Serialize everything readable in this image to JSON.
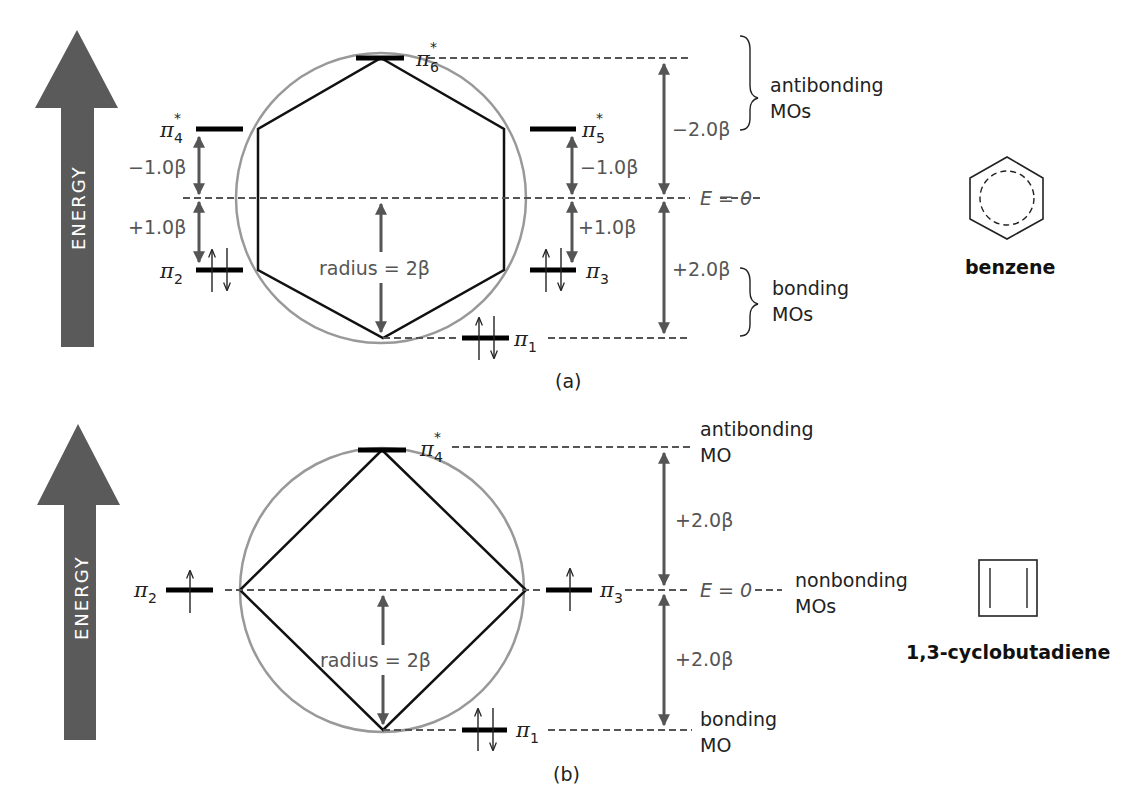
{
  "panel_a": {
    "caption": "(a)",
    "energy_label": "ENERGY",
    "molecule_name": "benzene",
    "levels": {
      "pi1": {
        "sym": "π",
        "sub": "1",
        "star": "",
        "electrons": "↑↓"
      },
      "pi2": {
        "sym": "π",
        "sub": "2",
        "star": "",
        "electrons": "↑↓"
      },
      "pi3": {
        "sym": "π",
        "sub": "3",
        "star": "",
        "electrons": "↑↓"
      },
      "pi4": {
        "sym": "π",
        "sub": "4",
        "star": "*",
        "electrons": ""
      },
      "pi5": {
        "sym": "π",
        "sub": "5",
        "star": "*",
        "electrons": ""
      },
      "pi6": {
        "sym": "π",
        "sub": "6",
        "star": "*",
        "electrons": ""
      }
    },
    "gaps": {
      "left_upper": "−1.0β",
      "left_lower": "+1.0β",
      "right_upper": "−1.0β",
      "right_lower": "+1.0β",
      "outer_upper": "−2.0β",
      "outer_lower": "+2.0β"
    },
    "radius_label": "radius = 2β",
    "zero_label": "E = 0",
    "antibonding_label": [
      "antibonding",
      "MOs"
    ],
    "bonding_label": [
      "bonding",
      "MOs"
    ]
  },
  "panel_b": {
    "caption": "(b)",
    "energy_label": "ENERGY",
    "molecule_name": "1,3-cyclobutadiene",
    "levels": {
      "pi1": {
        "sym": "π",
        "sub": "1",
        "star": "",
        "electrons": "↑↓"
      },
      "pi2": {
        "sym": "π",
        "sub": "2",
        "star": "",
        "electrons": "↑"
      },
      "pi3": {
        "sym": "π",
        "sub": "3",
        "star": "",
        "electrons": "↑"
      },
      "pi4": {
        "sym": "π",
        "sub": "4",
        "star": "*",
        "electrons": ""
      }
    },
    "gaps": {
      "outer_upper": "+2.0β",
      "outer_lower": "+2.0β"
    },
    "radius_label": "radius = 2β",
    "zero_label": "E = 0",
    "antibonding_label": [
      "antibonding",
      "MO"
    ],
    "nonbonding_label": [
      "nonbonding",
      "MOs"
    ],
    "bonding_label": [
      "bonding",
      "MO"
    ]
  }
}
